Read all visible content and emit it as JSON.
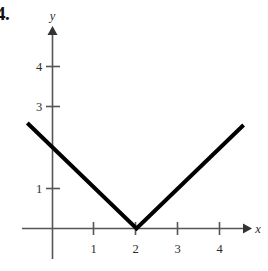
{
  "figure": {
    "problem_number": "4.",
    "background_color": "#ffffff",
    "curve_color": "#000000",
    "axis_color": "#555555",
    "label_color": "#2b2b2b"
  },
  "chart_data": {
    "type": "line",
    "title": "",
    "subtitle": "",
    "xlabel": "x",
    "ylabel": "y",
    "grid": false,
    "legend": null,
    "xlim": [
      -0.6,
      4.8
    ],
    "ylim": [
      -0.25,
      5.0
    ],
    "x_ticks": [
      1,
      2,
      3,
      4
    ],
    "x_tick_labels": [
      "1",
      "2",
      "3",
      "4"
    ],
    "y_ticks": [
      1,
      3,
      4
    ],
    "y_tick_labels": [
      "1",
      "3",
      "4"
    ],
    "series": [
      {
        "name": "y = |x - 2|",
        "x": [
          -0.6,
          2,
          4.55
        ],
        "values": [
          2.6,
          0,
          2.55
        ],
        "vertex": [
          2,
          0
        ],
        "y_intercept": 2,
        "x_intercept": 2,
        "style": "piecewise-linear",
        "linewidth": 4,
        "color": "#000000"
      }
    ],
    "annotations": []
  },
  "axes": {
    "x_axis_label": "x",
    "y_axis_label": "y",
    "x_arrow": "arrow-right",
    "y_arrow": "arrow-up"
  }
}
